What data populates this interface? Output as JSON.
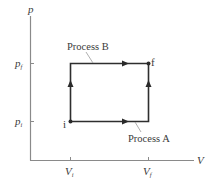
{
  "diagram": {
    "type": "pV-diagram",
    "axes": {
      "y_label": "p",
      "x_label": "V"
    },
    "y_ticks": [
      {
        "label_main": "p",
        "label_sub": "f",
        "position": "upper"
      },
      {
        "label_main": "p",
        "label_sub": "i",
        "position": "lower"
      }
    ],
    "x_ticks": [
      {
        "label_main": "V",
        "label_sub": "i",
        "position": "left"
      },
      {
        "label_main": "V",
        "label_sub": "f",
        "position": "right"
      }
    ],
    "points": [
      {
        "label": "i",
        "location": "initial state (Vi, pi)"
      },
      {
        "label": "f",
        "location": "final state (Vf, pf)"
      }
    ],
    "processes": [
      {
        "label": "Process A",
        "route": "i → (Vf, pi) → f",
        "description": "isobaric expansion then isochoric pressure increase"
      },
      {
        "label": "Process B",
        "route": "i → (Vi, pf) → f",
        "description": "isochoric pressure increase then isobaric expansion"
      }
    ],
    "colors": {
      "axes": "#8a8a8a",
      "paths": "#2e2e2e",
      "text": "#3a3a3a",
      "background": "#ffffff"
    }
  }
}
